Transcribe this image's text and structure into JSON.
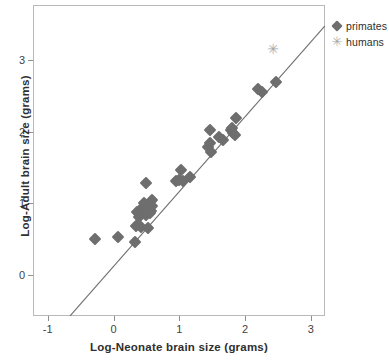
{
  "chart_data": {
    "type": "scatter",
    "title": "",
    "xlabel": "Log-Neonate brain size (grams)",
    "ylabel": "Log-Adult brain size (grams)",
    "xlim": [
      -1.25,
      3.2
    ],
    "ylim": [
      -0.57,
      3.48
    ],
    "xticks": [
      -1,
      0,
      1,
      2,
      3
    ],
    "xticklabels": [
      "-1",
      "0",
      "1",
      "2",
      "3"
    ],
    "yticks": [
      0,
      1,
      2,
      3
    ],
    "yticklabels": [
      "0",
      "1",
      "2",
      "3"
    ],
    "grid": false,
    "legend_position": "outside-top-right",
    "legend": [
      {
        "label": "primates",
        "marker": "diamond",
        "color": "#6e6e6e"
      },
      {
        "label": "humans",
        "marker": "asterisk",
        "color": "#a8a8a8"
      }
    ],
    "fit_line": {
      "name": "regression-line",
      "color": "#6e6e6e",
      "x_start": -0.66,
      "y_start": -0.57,
      "x_end": 3.21,
      "y_end": 3.47,
      "slope": 1.044,
      "intercept": 0.119
    },
    "series": [
      {
        "name": "primates",
        "marker": "diamond",
        "color": "#6e6e6e",
        "points": [
          [
            -0.28,
            0.5
          ],
          [
            0.07,
            0.53
          ],
          [
            0.33,
            0.46
          ],
          [
            0.34,
            0.68
          ],
          [
            0.36,
            0.88
          ],
          [
            0.38,
            0.81
          ],
          [
            0.42,
            0.67
          ],
          [
            0.45,
            0.95
          ],
          [
            0.46,
            0.88
          ],
          [
            0.47,
            1.0
          ],
          [
            0.49,
            0.84
          ],
          [
            0.52,
            0.9
          ],
          [
            0.53,
            0.66
          ],
          [
            0.55,
            0.86
          ],
          [
            0.57,
            0.89
          ],
          [
            0.58,
            1.05
          ],
          [
            0.58,
            0.96
          ],
          [
            0.5,
            1.28
          ],
          [
            0.95,
            1.31
          ],
          [
            1.0,
            1.33
          ],
          [
            1.02,
            1.46
          ],
          [
            1.05,
            1.31
          ],
          [
            1.16,
            1.36
          ],
          [
            1.44,
            1.79
          ],
          [
            1.46,
            2.02
          ],
          [
            1.47,
            1.84
          ],
          [
            1.48,
            1.71
          ],
          [
            1.6,
            1.92
          ],
          [
            1.66,
            1.88
          ],
          [
            1.78,
            2.02
          ],
          [
            1.8,
            2.05
          ],
          [
            1.82,
            1.98
          ],
          [
            1.84,
            1.95
          ],
          [
            1.86,
            2.19
          ],
          [
            2.19,
            2.59
          ],
          [
            2.25,
            2.55
          ],
          [
            2.47,
            2.69
          ]
        ]
      },
      {
        "name": "humans",
        "marker": "asterisk",
        "color": "#a8a8a8",
        "points": [
          [
            2.42,
            3.15
          ]
        ]
      }
    ]
  },
  "axis": {
    "x_title": "Log-Neonate brain size (grams)",
    "y_title": "Log-Adult brain size (grams)"
  },
  "legend": {
    "primates_label": "primates",
    "humans_label": "humans",
    "primates_marker_glyph": "",
    "humans_marker_glyph": "✳"
  }
}
